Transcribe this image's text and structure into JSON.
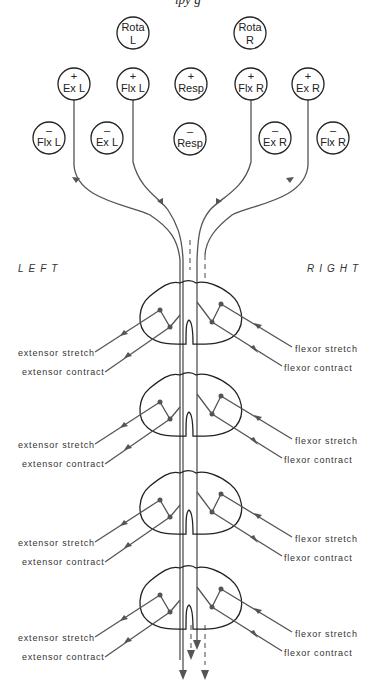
{
  "top_caption_fragment": "ipy  g",
  "side_labels": {
    "left": "LEFT",
    "right": "RIGHT"
  },
  "rotation_nodes": [
    {
      "id": "rota-l",
      "line1": "Rota",
      "line2": "L",
      "cx": 133,
      "cy": 33
    },
    {
      "id": "rota-r",
      "line1": "Rota",
      "line2": "R",
      "cx": 250,
      "cy": 33
    }
  ],
  "excitatory_nodes": [
    {
      "id": "ex-l-plus",
      "sign": "+",
      "label": "Ex  L",
      "cx": 74,
      "cy": 84
    },
    {
      "id": "flx-l-plus",
      "sign": "+",
      "label": "Flx  L",
      "cx": 133,
      "cy": 84
    },
    {
      "id": "resp-plus",
      "sign": "+",
      "label": "Resp",
      "cx": 191,
      "cy": 84
    },
    {
      "id": "flx-r-plus",
      "sign": "+",
      "label": "Flx R",
      "cx": 251,
      "cy": 84
    },
    {
      "id": "ex-r-plus",
      "sign": "+",
      "label": "Ex  R",
      "cx": 308,
      "cy": 84
    }
  ],
  "inhibitory_nodes": [
    {
      "id": "flx-l-minus",
      "sign": "-",
      "label": "Flx  L",
      "cx": 49,
      "cy": 138
    },
    {
      "id": "ex-l-minus",
      "sign": "-",
      "label": "Ex  L",
      "cx": 107,
      "cy": 138
    },
    {
      "id": "resp-minus",
      "sign": "-",
      "label": "Resp",
      "cx": 190,
      "cy": 139
    },
    {
      "id": "ex-r-minus",
      "sign": "-",
      "label": "Ex  R",
      "cx": 275,
      "cy": 138
    },
    {
      "id": "flx-r-minus",
      "sign": "-",
      "label": "Flx  R",
      "cx": 333,
      "cy": 138
    }
  ],
  "segments": [
    {
      "index": 1,
      "y": 280,
      "left_stretch": "extensor  stretch",
      "left_contract": "extensor  contract",
      "right_stretch": "flexor  stretch",
      "right_contract": "flexor  contract"
    },
    {
      "index": 2,
      "y": 372,
      "left_stretch": "extensor  stretch",
      "left_contract": "extensor  contract",
      "right_stretch": "flexor  stretch",
      "right_contract": "flexor  contract"
    },
    {
      "index": 3,
      "y": 470,
      "left_stretch": "extensor  stretch",
      "left_contract": "extensor  contract",
      "right_stretch": "flexor  stretch",
      "right_contract": "flexor  contract"
    },
    {
      "index": 4,
      "y": 565,
      "left_stretch": "extensor  stretch",
      "left_contract": "extensor  contract",
      "right_stretch": "flexor  stretch",
      "right_contract": "flexor  contract"
    }
  ],
  "colors": {
    "ink": "#222222",
    "tract": "#555555",
    "background": "#ffffff"
  }
}
